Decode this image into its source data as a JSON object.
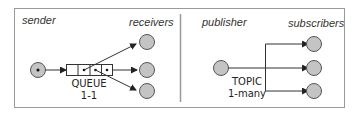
{
  "diagram": {
    "left_panel": {
      "sender_label": "sender",
      "receivers_label": "receivers",
      "queue_label": "QUEUE",
      "queue_ratio": "1-1"
    },
    "right_panel": {
      "publisher_label": "publisher",
      "subscribers_label": "subscribers",
      "topic_label": "TOPIC",
      "topic_ratio": "1-many"
    },
    "colors": {
      "node_fill": "#c4c4c4",
      "node_stroke": "#555555",
      "border": "#999999",
      "line": "#333333"
    }
  }
}
